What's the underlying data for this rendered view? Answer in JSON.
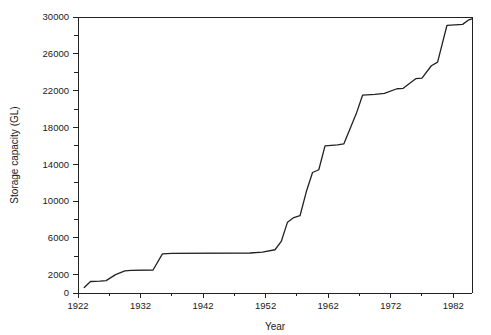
{
  "chart_data": {
    "type": "line",
    "title": "",
    "xlabel": "Year",
    "ylabel": "Storage capacity (GL)",
    "xlim": [
      1922,
      1985
    ],
    "ylim": [
      0,
      30000
    ],
    "grid": false,
    "legend": null,
    "x_ticks_major": [
      1922,
      1932,
      1942,
      1952,
      1962,
      1972,
      1982
    ],
    "x_tick_labels": [
      "1922",
      "1932",
      "1942",
      "1952",
      "1962",
      "1972",
      "1982"
    ],
    "x_ticks_minor": [
      1927,
      1937,
      1947,
      1957,
      1967,
      1977
    ],
    "y_ticks_major": [
      0,
      2000,
      6000,
      10000,
      14000,
      18000,
      22000,
      26000,
      30000
    ],
    "y_tick_labels": [
      "0",
      "2000",
      "6000",
      "10000",
      "14000",
      "18000",
      "22000",
      "26000",
      "30000"
    ],
    "y_ticks_minor": [
      4000,
      8000,
      12000,
      16000,
      20000,
      24000,
      28000
    ],
    "line_color": "#222222",
    "background_color": "#ffffff",
    "series": [
      {
        "name": "Storage capacity",
        "x": [
          1923,
          1924,
          1925.5,
          1926.5,
          1928,
          1929.5,
          1930.5,
          1934,
          1935.5,
          1937,
          1949.5,
          1951.5,
          1953.5,
          1954.5,
          1955.5,
          1956.5,
          1957.5,
          1958.5,
          1959.5,
          1960.5,
          1961.5,
          1963.5,
          1964.5,
          1966.5,
          1967.5,
          1969.5,
          1971,
          1973,
          1974,
          1976,
          1977,
          1978.5,
          1979.5,
          1981,
          1983.5,
          1984.5,
          1985
        ],
        "y": [
          600,
          1250,
          1300,
          1350,
          2000,
          2400,
          2450,
          2500,
          4250,
          4300,
          4350,
          4450,
          4700,
          5600,
          7700,
          8200,
          8400,
          11000,
          13100,
          13400,
          16000,
          16100,
          16200,
          19500,
          21500,
          21600,
          21700,
          22200,
          22250,
          23300,
          23350,
          24700,
          25100,
          29100,
          29200,
          29700,
          29800
        ]
      }
    ]
  },
  "axes": {
    "x_title": "Year",
    "y_title": "Storage capacity (GL)"
  }
}
